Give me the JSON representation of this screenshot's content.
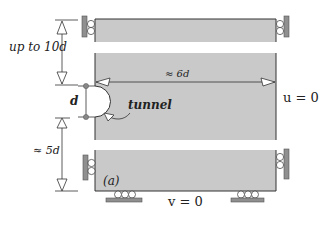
{
  "figure": {
    "panel_label": "(a)",
    "annotations": {
      "top_height": "up to 10d",
      "width": "≈ 6d",
      "tunnel_diameter": "d",
      "tunnel_label": "tunnel",
      "bottom_height": "≈ 5d",
      "right_bc": "u = 0",
      "bottom_bc": "v = 0"
    },
    "colors": {
      "domain_fill": "#c9c9c9",
      "support_plate": "#8f8f8f",
      "line": "#333333",
      "background": "#ffffff"
    }
  }
}
